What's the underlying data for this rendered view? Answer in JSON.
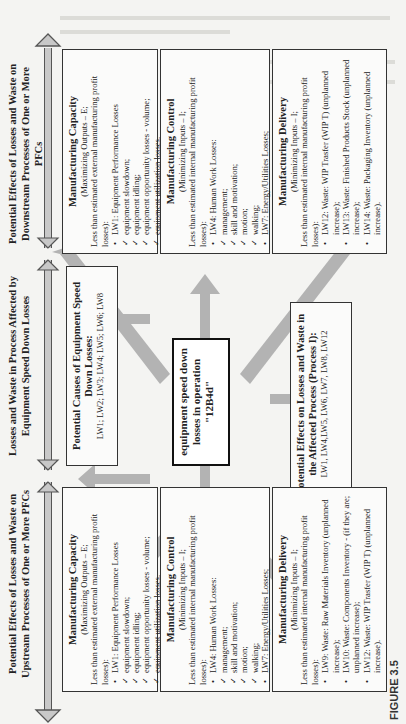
{
  "figure": {
    "label": "FIGURE 3.5",
    "headers": {
      "downstream": "Potential Effects of Losses and Waste on Downstream Processes of One or More PFCs",
      "process": "Losses and Waste in Process Affected by Equipment Speed Down Losses",
      "upstream": "Potential Effects of Losses and Waste on Upstream Processes of One or More PFCs"
    },
    "center": "equipment speed down losses in operation \"12B4d\"",
    "causes": {
      "title": "Potential Causes of Equipment Speed Down Losses:",
      "items": "LW1; LW2; LW3; LW4; LW5; LW6; LW8"
    },
    "effects": {
      "title": "Potential Effects on Losses and Waste in the Affected Process (Process I):",
      "items": "LW1, LW4,LW5, LW6, LW7, LW8, LW12"
    },
    "downstream": {
      "capacity": {
        "title": "Manufacturing Capacity",
        "sub": "(Maximizing Outputs – E;",
        "intro": "Less than estimated external manufacturing profit  losses):",
        "items": [
          {
            "type": "b",
            "text": "LW1: Equipment Performance Losses"
          },
          {
            "type": "c",
            "text": "equipment slowdown;"
          },
          {
            "type": "c",
            "text": "equipment idling;"
          },
          {
            "type": "c",
            "text": "equipment opportunity losses - volume;"
          },
          {
            "type": "c",
            "text": "equipment utilization losses."
          }
        ]
      },
      "control": {
        "title": "Manufacturing Control",
        "sub": "(Minimizing Inputs – I;",
        "intro": "Less than estimated internal manufacturing profit  losses):",
        "items": [
          {
            "type": "b",
            "text": "LW4: Human Work Losses:"
          },
          {
            "type": "c",
            "text": "management;"
          },
          {
            "type": "c",
            "text": "skill and motivation;"
          },
          {
            "type": "c",
            "text": "motion;"
          },
          {
            "type": "c",
            "text": "walking;"
          },
          {
            "type": "b",
            "text": "LW7: Energy/Utilities Losses;"
          },
          {
            "type": "b",
            "text": "LW8: Internal Logistics/Material Handling Losses."
          }
        ]
      },
      "delivery": {
        "title": "Manufacturing Delivery",
        "sub": "(Minimizing Inputs – I;",
        "intro": "Less than estimated internal manufacturing profit  losses):",
        "items": [
          {
            "type": "b",
            "text": "LW12: Waste: WIP Trasfer (WIP T) (unplanned increase);"
          },
          {
            "type": "b",
            "text": "LW13: Waste: Finished Products Stock (unplanned increase);"
          },
          {
            "type": "b",
            "text": "LW14: Waste: Packaging Inventory (unplanned increase)."
          }
        ]
      }
    },
    "upstream": {
      "capacity": {
        "title": "Manufacturing Capacity",
        "sub": "(Maximizing Outputs – E;",
        "intro": "Less than estimated external manufacturing profit  losses):",
        "items": [
          {
            "type": "b",
            "text": "LW1: Equipment Performance Losses"
          },
          {
            "type": "c",
            "text": "equipment slowdown;"
          },
          {
            "type": "c",
            "text": "equipment idling;"
          },
          {
            "type": "c",
            "text": "equipment opportunity losses - volume;"
          },
          {
            "type": "c",
            "text": "equipment utilization losses."
          }
        ]
      },
      "control": {
        "title": "Manufacturing Control",
        "sub": "(Minimizing Inputs – I;",
        "intro": "Less than estimated internal manufacturing profit  losses):",
        "items": [
          {
            "type": "b",
            "text": "LW4: Human Work Losses:"
          },
          {
            "type": "c",
            "text": "management;"
          },
          {
            "type": "c",
            "text": "skill and motivation;"
          },
          {
            "type": "c",
            "text": "motion;"
          },
          {
            "type": "c",
            "text": "walking;"
          },
          {
            "type": "b",
            "text": "LW7: Energy/Utilities Losses;"
          },
          {
            "type": "b",
            "text": "LW8: Internal Logistics/Material Handling Losses."
          }
        ]
      },
      "delivery": {
        "title": "Manufacturing Delivery",
        "sub": "(Minimizing Inputs – I;",
        "intro": "Less than estimated internal manufacturing profit  losses):",
        "items": [
          {
            "type": "b",
            "text": "LW9: Waste: Raw Materials Inventory (unplanned increase);"
          },
          {
            "type": "b",
            "text": "LW10: Waste: Components Inventory - (if they are; unplanned increase);"
          },
          {
            "type": "b",
            "text": "LW12: Waste: WIP Trasfer (WIP T) (unplanned increase)."
          }
        ]
      }
    }
  }
}
